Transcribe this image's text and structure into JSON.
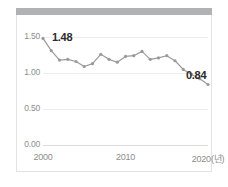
{
  "card": {
    "header_bar_color": "#b0b2b4",
    "border_color": "#e3e3e3",
    "background": "#ffffff"
  },
  "chart_data": {
    "type": "line",
    "title": "",
    "subtitle": "",
    "xlabel": "2020(년)",
    "ylabel": "",
    "x": [
      2000,
      2001,
      2002,
      2003,
      2004,
      2005,
      2006,
      2007,
      2008,
      2009,
      2010,
      2011,
      2012,
      2013,
      2014,
      2015,
      2016,
      2017,
      2018,
      2019,
      2020
    ],
    "values": [
      1.48,
      1.31,
      1.18,
      1.19,
      1.16,
      1.09,
      1.13,
      1.26,
      1.19,
      1.15,
      1.23,
      1.24,
      1.3,
      1.19,
      1.21,
      1.24,
      1.17,
      1.05,
      0.98,
      0.92,
      0.84
    ],
    "series": [
      {
        "name": "합계출산율",
        "values": [
          1.48,
          1.31,
          1.18,
          1.19,
          1.16,
          1.09,
          1.13,
          1.26,
          1.19,
          1.15,
          1.23,
          1.24,
          1.3,
          1.19,
          1.21,
          1.24,
          1.17,
          1.05,
          0.98,
          0.92,
          0.84
        ]
      }
    ],
    "xticks": [
      {
        "value": 2000,
        "label": "2000"
      },
      {
        "value": 2010,
        "label": "2010"
      },
      {
        "value": 2020,
        "label": "2020(년)"
      }
    ],
    "yticks": [
      {
        "value": 0.0,
        "label": "0.00"
      },
      {
        "value": 0.5,
        "label": "0.50"
      },
      {
        "value": 1.0,
        "label": "1.00"
      },
      {
        "value": 1.5,
        "label": "1.50"
      }
    ],
    "xlim": [
      2000,
      2020
    ],
    "ylim": [
      0.0,
      1.5
    ],
    "grid": true,
    "legend": false,
    "legend_position": "none",
    "annotations": [
      {
        "name": "start-value",
        "text": "1.48",
        "x": 2000,
        "y": 1.48
      },
      {
        "name": "end-value",
        "text": "0.84",
        "x": 2020,
        "y": 0.84
      }
    ],
    "line_color": "#9a9a9a",
    "marker_color": "#9a9a9a",
    "grid_color": "#ececec",
    "tick_color": "#8d8d8d",
    "annotation_color": "#2b2b2b"
  }
}
